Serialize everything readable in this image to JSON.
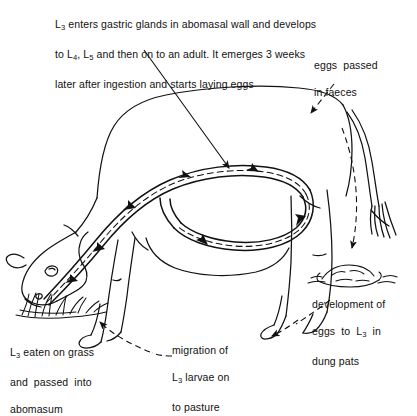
{
  "diagram": {
    "background_color": "#ffffff",
    "ink_color": "#111111"
  },
  "labels": {
    "top_note": {
      "name": "parasite-development-note",
      "lines": [
        "L3 enters gastric glands in abomasal wall and develops",
        "to L4, L5 and then on to an adult. It emerges 3 weeks",
        "later after ingestion and starts laying eggs"
      ],
      "text": "L3 enters gastric glands in abomasal wall and develops to L4, L5 and then on to an adult. It emerges 3 weeks later after ingestion and starts laying eggs",
      "stage_tokens": [
        "L3",
        "L4",
        "L5"
      ]
    },
    "eggs_in_faeces": {
      "name": "eggs-passed-in-faeces",
      "lines": [
        "eggs  passed",
        "in faeces"
      ],
      "text": "eggs passed in faeces"
    },
    "dung_development": {
      "name": "development-of-eggs-in-dung-pats",
      "lines": [
        "development of",
        "eggs  to  L3  in",
        "dung pats"
      ],
      "text": "development of eggs to L3 in dung pats",
      "stage_tokens": [
        "L3"
      ]
    },
    "migration": {
      "name": "migration-of-larvae-to-pasture",
      "lines": [
        "migration of",
        "L3 larvae on",
        "to pasture"
      ],
      "text": "migration of L3 larvae on to pasture",
      "stage_tokens": [
        "L3"
      ]
    },
    "ingestion": {
      "name": "larvae-eaten-on-grass",
      "lines": [
        "L3 eaten on grass",
        "and  passed  into",
        "abomasum"
      ],
      "text": "L3 eaten on grass and passed into abomasum",
      "stage_tokens": [
        "L3"
      ]
    }
  },
  "figure_parts": {
    "animal": "cow",
    "pose": "head-down-grazing",
    "gut_tract": "oesophagus-abomasum-intestine",
    "grass_tuft": "grass",
    "dung_pat": "dung-pat",
    "tail": "tail"
  },
  "arrows": [
    {
      "name": "note-pointer-arrow",
      "style": "solid",
      "from": "top_note",
      "to": "abomasum"
    },
    {
      "name": "eggs-faeces-arrow",
      "style": "dashed",
      "from": "eggs_in_faeces",
      "to": "rear-of-cow"
    },
    {
      "name": "faeces-to-dung-arrow",
      "style": "dashed",
      "from": "rear-of-cow",
      "to": "dung_pat"
    },
    {
      "name": "dung-to-pasture-arrow",
      "style": "dashed",
      "from": "dung_pat",
      "to": "pasture"
    },
    {
      "name": "pasture-to-grass-arrow",
      "style": "dashed",
      "from": "pasture",
      "to": "grass_tuft"
    },
    {
      "name": "gut-flow-arrow-1",
      "style": "solid",
      "from": "mouth",
      "to": "abomasum"
    },
    {
      "name": "gut-flow-arrow-2",
      "style": "solid",
      "from": "abomasum",
      "to": "intestine"
    }
  ]
}
